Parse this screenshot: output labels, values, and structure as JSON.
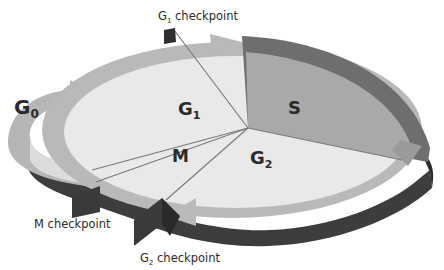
{
  "diagram": {
    "type": "cell-cycle",
    "phases": [
      {
        "id": "G0",
        "base": "G",
        "sub": "0"
      },
      {
        "id": "G1",
        "base": "G",
        "sub": "1"
      },
      {
        "id": "S",
        "base": "S",
        "sub": ""
      },
      {
        "id": "G2",
        "base": "G",
        "sub": "2"
      },
      {
        "id": "M",
        "base": "M",
        "sub": ""
      }
    ],
    "checkpoints": [
      {
        "id": "G1",
        "base": "G",
        "sub": "1",
        "suffix": " checkpoint"
      },
      {
        "id": "G2",
        "base": "G",
        "sub": "2",
        "suffix": " checkpoint"
      },
      {
        "id": "M",
        "base": "M",
        "sub": "",
        "suffix": " checkpoint"
      }
    ],
    "colors": {
      "disc_top": "#e9e9e9",
      "s_sector": "#a9a9a9",
      "ring": "#b9b9b9",
      "ring_dark": "#6e6e6e",
      "side": "#3d3d3d",
      "flag": "#3a3a3a",
      "line": "#7a7a7a"
    }
  }
}
